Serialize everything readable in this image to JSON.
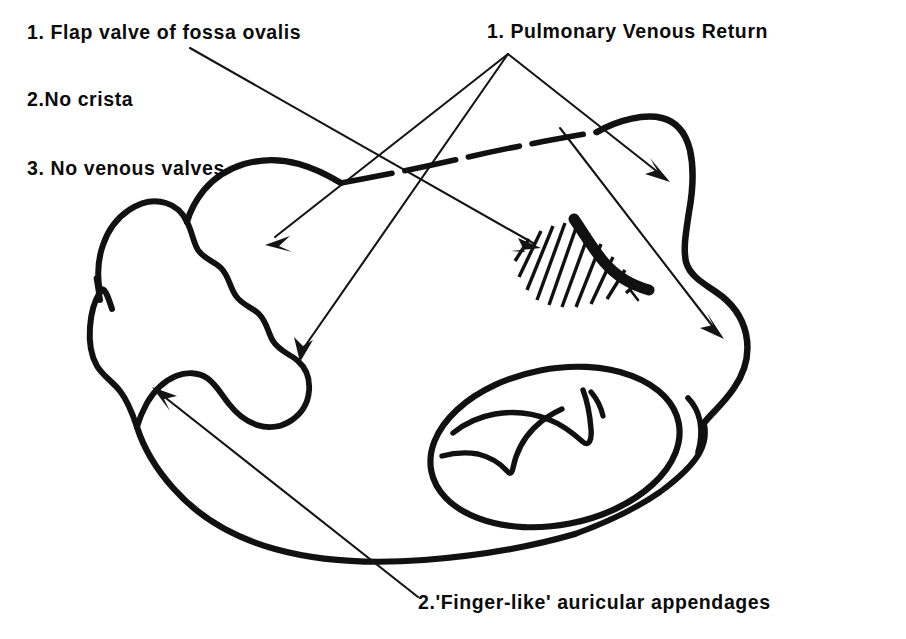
{
  "figure": {
    "background_color": "#ffffff",
    "ink_color": "#111111",
    "width": 906,
    "height": 639
  },
  "labels": {
    "flap_valve": "1. Flap valve of fossa ovalis",
    "no_crista": "2.No crista",
    "no_venous_valves": "3. No venous valves",
    "pulmonary_venous_return": "1. Pulmonary Venous Return",
    "finger_like_appendages": "2.'Finger-like' auricular appendages"
  },
  "annotations": {
    "left_list_heading_count": 3,
    "right_list_heading_count": 2,
    "leader_origin_pulmonary": "508,54",
    "leader_origin_flap_valve": "190,48",
    "leader_origin_appendages": "418,597"
  },
  "structures": {
    "atrial_chamber": "right atrium body outline",
    "fossa_ovalis": "hatched oval region with thick crescent flap valve",
    "tricuspid_orifice": "ellipse with valve leaflet cusps",
    "left_appendage": "finger-like auricular appendage with scalloped margin",
    "cut_edge": "dashed superior cut margin"
  }
}
